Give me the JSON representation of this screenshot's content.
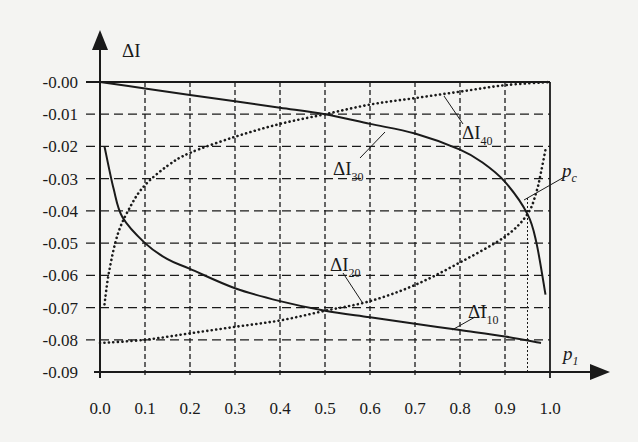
{
  "chart_data": {
    "type": "line",
    "title": "",
    "xlabel": "p_1",
    "ylabel": "ΔI",
    "xlim": [
      0.0,
      1.0
    ],
    "ylim": [
      -0.09,
      0.0
    ],
    "grid": true,
    "grid_style": "dashed",
    "legend_position": "inline labels with leader lines",
    "x_ticks": [
      "0.0",
      "0.1",
      "0.2",
      "0.3",
      "0.4",
      "0.5",
      "0.6",
      "0.7",
      "0.8",
      "0.9",
      "1.0"
    ],
    "y_ticks": [
      "-0.00",
      "-0.01",
      "-0.02",
      "-0.03",
      "-0.04",
      "-0.05",
      "-0.06",
      "-0.07",
      "-0.08",
      "-0.09"
    ],
    "series": [
      {
        "name": "ΔI10",
        "style": "solid",
        "x": [
          0.01,
          0.03,
          0.05,
          0.1,
          0.15,
          0.2,
          0.3,
          0.4,
          0.5,
          0.6,
          0.7,
          0.8,
          0.9,
          0.98
        ],
        "values": [
          -0.02,
          -0.033,
          -0.042,
          -0.05,
          -0.055,
          -0.058,
          -0.064,
          -0.068,
          -0.071,
          -0.073,
          -0.075,
          -0.077,
          -0.079,
          -0.081
        ]
      },
      {
        "name": "ΔI20",
        "style": "dotted",
        "x": [
          0.0,
          0.1,
          0.2,
          0.3,
          0.4,
          0.5,
          0.6,
          0.7,
          0.8,
          0.9,
          0.95,
          0.97,
          0.98,
          0.99
        ],
        "values": [
          -0.081,
          -0.08,
          -0.078,
          -0.076,
          -0.074,
          -0.071,
          -0.068,
          -0.063,
          -0.056,
          -0.048,
          -0.041,
          -0.034,
          -0.028,
          -0.021
        ]
      },
      {
        "name": "ΔI30",
        "style": "solid",
        "x": [
          0.0,
          0.1,
          0.2,
          0.3,
          0.4,
          0.5,
          0.6,
          0.7,
          0.8,
          0.85,
          0.9,
          0.95,
          0.97,
          0.99
        ],
        "values": [
          0.0,
          -0.002,
          -0.004,
          -0.006,
          -0.008,
          -0.01,
          -0.013,
          -0.016,
          -0.021,
          -0.025,
          -0.031,
          -0.041,
          -0.05,
          -0.066
        ]
      },
      {
        "name": "ΔI40",
        "style": "dotted",
        "x": [
          0.01,
          0.02,
          0.04,
          0.07,
          0.1,
          0.15,
          0.2,
          0.3,
          0.4,
          0.5,
          0.6,
          0.7,
          0.8,
          0.9,
          1.0
        ],
        "values": [
          -0.069,
          -0.059,
          -0.047,
          -0.038,
          -0.032,
          -0.026,
          -0.022,
          -0.017,
          -0.013,
          -0.01,
          -0.007,
          -0.005,
          -0.003,
          -0.001,
          0.0
        ]
      }
    ],
    "annotations": [
      {
        "text": "ΔI10",
        "x": 0.86,
        "y": -0.073
      },
      {
        "text": "ΔI20",
        "x": 0.53,
        "y": -0.063
      },
      {
        "text": "ΔI30",
        "x": 0.53,
        "y": -0.021
      },
      {
        "text": "ΔI40",
        "x": 0.83,
        "y": -0.014
      },
      {
        "text": "p_c",
        "x": 1.02,
        "y": -0.028,
        "marks_vertical_at_x": 0.95
      }
    ]
  },
  "labels": {
    "y_axis": "ΔI",
    "x_axis": "p",
    "x_axis_sub": "1",
    "pc": "p",
    "pc_sub": "c",
    "s10": "ΔI",
    "s10_sub": "10",
    "s20": "ΔI",
    "s20_sub": "20",
    "s30": "ΔI",
    "s30_sub": "30",
    "s40": "ΔI",
    "s40_sub": "40"
  }
}
